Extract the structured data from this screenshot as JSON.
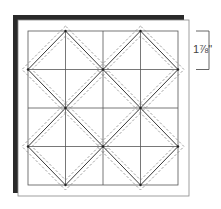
{
  "diagram": {
    "grid": {
      "columns": 4,
      "rows": 4
    },
    "dimension_label": "1⅞\"",
    "colors": {
      "backing": "#2a2a2a",
      "panel": "#ffffff",
      "grid_line": "#555555",
      "diamond_line": "#222222",
      "seam_dash": "#777777",
      "bracket": "#555555"
    }
  }
}
